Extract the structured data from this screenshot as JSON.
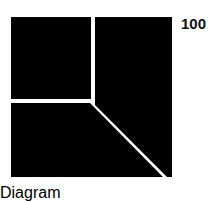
{
  "figure": {
    "title": "",
    "label": "100",
    "background_color": "#ffffff",
    "fill_color": "#000000",
    "divider_color": "#ffffff",
    "square": {
      "left": 11,
      "top": 17,
      "right": 172,
      "bottom": 177,
      "width": 161,
      "height": 160
    },
    "junction": {
      "x": 93,
      "y": 101
    },
    "divider_width": 3,
    "regions": [
      {
        "name": "top-left-region",
        "points": "11,17 91,17 91,99 11,99"
      },
      {
        "name": "right-region",
        "points": "95,17 172,17 172,177 168,177 95,104"
      },
      {
        "name": "bottom-left-region",
        "points": "11,103 90,103 163,177 11,177"
      }
    ],
    "dividers": [
      {
        "name": "vertical-divider",
        "from": "93,17",
        "to": "93,101"
      },
      {
        "name": "horizontal-divider",
        "from": "11,101",
        "to": "93,101"
      },
      {
        "name": "diagonal-divider",
        "from": "93,101",
        "to": "172,177"
      }
    ]
  },
  "chart_data": {
    "type": "pie",
    "title": "",
    "categories": [
      "top-left",
      "right",
      "bottom-left"
    ],
    "values": [
      25,
      40,
      35
    ],
    "annotations": [
      "100"
    ],
    "xlabel": "",
    "ylabel": "",
    "legend": "none",
    "grid": false
  }
}
